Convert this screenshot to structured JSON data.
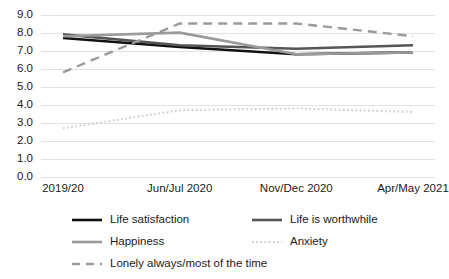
{
  "chart_data": {
    "type": "line",
    "title": "",
    "xlabel": "",
    "ylabel": "",
    "categories": [
      "2019/20",
      "Jun/Jul 2020",
      "Nov/Dec 2020",
      "Apr/May 2021"
    ],
    "ylim": [
      0.0,
      9.0
    ],
    "ytick_labels": [
      "9.0",
      "8.0",
      "7.0",
      "6.0",
      "5.0",
      "4.0",
      "3.0",
      "2.0",
      "1.0",
      "0.0"
    ],
    "ytick_values": [
      9.0,
      8.0,
      7.0,
      6.0,
      5.0,
      4.0,
      3.0,
      2.0,
      1.0,
      0.0
    ],
    "grid": true,
    "legend_position": "bottom",
    "series": [
      {
        "name": "Life satisfaction",
        "values": [
          7.7,
          7.2,
          6.8,
          6.9
        ],
        "color": "#111111",
        "style": "solid",
        "width": 2.6
      },
      {
        "name": "Life is worthwhile",
        "values": [
          7.9,
          7.3,
          7.1,
          7.3
        ],
        "color": "#555555",
        "style": "solid",
        "width": 2.6
      },
      {
        "name": "Happiness",
        "values": [
          7.8,
          8.0,
          6.8,
          6.9
        ],
        "color": "#9a9a9a",
        "style": "solid",
        "width": 2.6
      },
      {
        "name": "Anxiety",
        "values": [
          2.7,
          3.7,
          3.8,
          3.6
        ],
        "color": "#c9c9c9",
        "style": "dotted",
        "width": 2.0
      },
      {
        "name": "Lonely always/most of the time",
        "values": [
          5.8,
          8.5,
          8.5,
          7.8
        ],
        "color": "#9a9a9a",
        "style": "dashed",
        "width": 2.4
      }
    ]
  },
  "legend": {
    "rows": [
      [
        {
          "label": "Life satisfaction",
          "series_index": 0
        },
        {
          "label": "Life is worthwhile",
          "series_index": 1
        }
      ],
      [
        {
          "label": "Happiness",
          "series_index": 2
        },
        {
          "label": "Anxiety",
          "series_index": 3
        }
      ],
      [
        {
          "label": "Lonely always/most of the time",
          "series_index": 4
        }
      ]
    ]
  }
}
